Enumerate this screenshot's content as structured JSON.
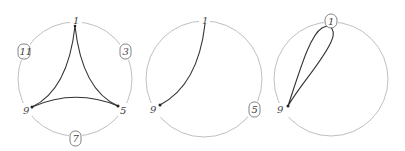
{
  "figure": {
    "panels": [
      {
        "id": "left",
        "labels": {
          "top": "1",
          "upper_right": "3",
          "lower_right": "5",
          "bottom": "7",
          "lower_left": "9",
          "upper_left": "11"
        },
        "boxed": [
          "3",
          "7",
          "11"
        ],
        "description": "Curved triangle connecting 1, 5, 9"
      },
      {
        "id": "middle",
        "labels": {
          "top": "1",
          "lower_left": "9",
          "lower_right": "5"
        },
        "boxed": [
          "5"
        ],
        "description": "Single arc from 1 to 9"
      },
      {
        "id": "right",
        "labels": {
          "top": "1",
          "lower_left": "9"
        },
        "boxed": [
          "1"
        ],
        "description": "Teardrop loop from 9 toward 1"
      }
    ]
  }
}
